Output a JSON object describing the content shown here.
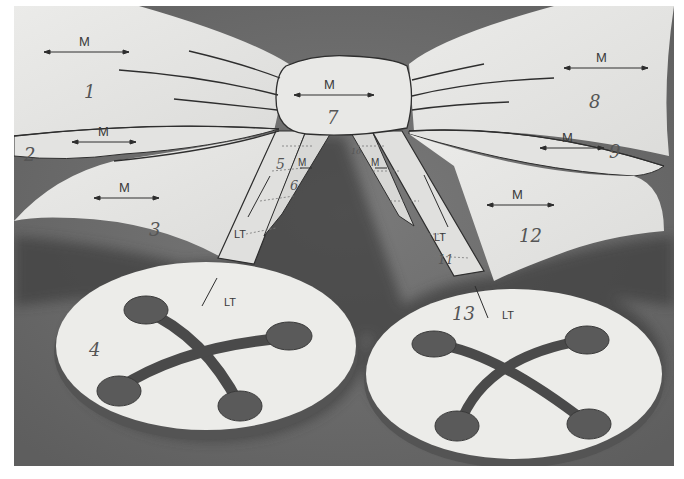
{
  "image": {
    "subject": "Paper-craft bow pattern pieces with two buttons, photographed in black and white",
    "colors": {
      "background": "#6e6e6e",
      "paper": "#e6e6e4",
      "shadow": "#4a4a4a",
      "ink": "#2e2e2e"
    }
  },
  "pieces": [
    {
      "number": "1",
      "grain": "M"
    },
    {
      "number": "2",
      "grain": "M"
    },
    {
      "number": "3",
      "grain": "M"
    },
    {
      "number": "4",
      "grain": "LT"
    },
    {
      "number": "5",
      "grain": "LT"
    },
    {
      "number": "6",
      "grain": "M"
    },
    {
      "number": "7",
      "grain": "M"
    },
    {
      "number": "8",
      "grain": "M"
    },
    {
      "number": "9",
      "grain": "M"
    },
    {
      "number": "10",
      "grain": "M"
    },
    {
      "number": "11",
      "grain": "LT"
    },
    {
      "number": "12",
      "grain": "M"
    },
    {
      "number": "13",
      "grain": "LT"
    }
  ]
}
